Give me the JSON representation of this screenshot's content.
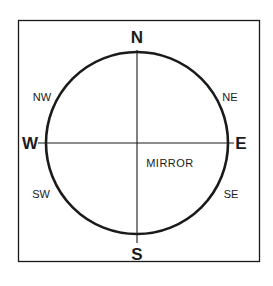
{
  "diagram": {
    "title": "",
    "colors": {
      "ink": "#1a1a1a",
      "background": "#ffffff"
    },
    "frame": {
      "x": 18,
      "y": 20,
      "width": 241,
      "height": 241
    },
    "circle": {
      "cx": 137,
      "cy": 143,
      "r": 91
    },
    "cross": {
      "vertical": {
        "x": 137,
        "y1": 50,
        "y2": 243
      },
      "horizontal": {
        "y": 143,
        "x1": 38,
        "x2": 234
      }
    },
    "labels": {
      "north": "N",
      "south": "S",
      "east": "E",
      "west": "W",
      "northeast": "NE",
      "northwest": "NW",
      "southeast": "SE",
      "southwest": "SW",
      "center_label": "MIRROR"
    }
  }
}
